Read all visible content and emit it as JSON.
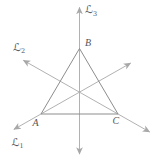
{
  "figure": {
    "colors": {
      "background": "#ffffff",
      "axis_line": "#a8a8a8",
      "triangle_edge": "#8d8d8d",
      "label_text": "#565656"
    },
    "triangle": {
      "vertices": [
        {
          "name": "A",
          "label": "A",
          "position": "bottom-left"
        },
        {
          "name": "B",
          "label": "B",
          "position": "top"
        },
        {
          "name": "C",
          "label": "C",
          "position": "bottom-right"
        }
      ]
    },
    "lines": [
      {
        "name": "L1",
        "label": "ℒ",
        "subscript": "1",
        "label_position": "lower-left",
        "passes_through": "A and midpoint of BC"
      },
      {
        "name": "L2",
        "label": "ℒ",
        "subscript": "2",
        "label_position": "upper-left",
        "passes_through": "C and midpoint of AB"
      },
      {
        "name": "L3",
        "label": "ℒ",
        "subscript": "3",
        "label_position": "top-right-of-arrow",
        "passes_through": "B and midpoint of AC"
      }
    ]
  }
}
